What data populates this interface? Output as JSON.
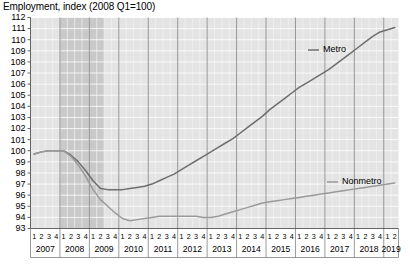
{
  "chart_data": {
    "type": "line",
    "title": "Employment, index (2008 Q1=100)",
    "xlabel": "",
    "ylabel": "",
    "ylim": [
      93,
      112
    ],
    "ytick_step": 1,
    "yticks": [
      112,
      111,
      110,
      109,
      108,
      107,
      106,
      105,
      104,
      103,
      102,
      101,
      100,
      99,
      98,
      97,
      96,
      95,
      94,
      93
    ],
    "grid": true,
    "legend_position": "inline-right",
    "quarter_labels": [
      "1",
      "2",
      "3",
      "4"
    ],
    "years": [
      {
        "year": "2007",
        "quarters": [
          "1",
          "2",
          "3",
          "4"
        ]
      },
      {
        "year": "2008",
        "quarters": [
          "1",
          "2",
          "3",
          "4"
        ]
      },
      {
        "year": "2009",
        "quarters": [
          "1",
          "2",
          "3",
          "4"
        ]
      },
      {
        "year": "2010",
        "quarters": [
          "1",
          "2",
          "3",
          "4"
        ]
      },
      {
        "year": "2011",
        "quarters": [
          "1",
          "2",
          "3",
          "4"
        ]
      },
      {
        "year": "2012",
        "quarters": [
          "1",
          "2",
          "3",
          "4"
        ]
      },
      {
        "year": "2013",
        "quarters": [
          "1",
          "2",
          "3",
          "4"
        ]
      },
      {
        "year": "2014",
        "quarters": [
          "1",
          "2",
          "3",
          "4"
        ]
      },
      {
        "year": "2015",
        "quarters": [
          "1",
          "2",
          "3",
          "4"
        ]
      },
      {
        "year": "2016",
        "quarters": [
          "1",
          "2",
          "3",
          "4"
        ]
      },
      {
        "year": "2017",
        "quarters": [
          "1",
          "2",
          "3",
          "4"
        ]
      },
      {
        "year": "2018",
        "quarters": [
          "1",
          "2",
          "3",
          "4"
        ]
      },
      {
        "year": "2019",
        "quarters": [
          "1",
          "2"
        ]
      }
    ],
    "x": [
      "2007Q1",
      "2007Q2",
      "2007Q3",
      "2007Q4",
      "2008Q1",
      "2008Q2",
      "2008Q3",
      "2008Q4",
      "2009Q1",
      "2009Q2",
      "2009Q3",
      "2009Q4",
      "2010Q1",
      "2010Q2",
      "2010Q3",
      "2010Q4",
      "2011Q1",
      "2011Q2",
      "2011Q3",
      "2011Q4",
      "2012Q1",
      "2012Q2",
      "2012Q3",
      "2012Q4",
      "2013Q1",
      "2013Q2",
      "2013Q3",
      "2013Q4",
      "2014Q1",
      "2014Q2",
      "2014Q3",
      "2014Q4",
      "2015Q1",
      "2015Q2",
      "2015Q3",
      "2015Q4",
      "2016Q1",
      "2016Q2",
      "2016Q3",
      "2016Q4",
      "2017Q1",
      "2017Q2",
      "2017Q3",
      "2017Q4",
      "2018Q1",
      "2018Q2",
      "2018Q3",
      "2018Q4",
      "2019Q1",
      "2019Q2"
    ],
    "series": [
      {
        "name": "Metro",
        "color": "#6e6e6e",
        "values": [
          99.7,
          99.9,
          100.0,
          100.0,
          100.0,
          99.6,
          99.0,
          98.2,
          97.3,
          96.6,
          96.5,
          96.5,
          96.5,
          96.6,
          96.7,
          96.8,
          97.0,
          97.3,
          97.6,
          97.9,
          98.3,
          98.7,
          99.1,
          99.5,
          99.9,
          100.3,
          100.7,
          101.1,
          101.6,
          102.1,
          102.6,
          103.1,
          103.7,
          104.2,
          104.7,
          105.2,
          105.7,
          106.1,
          106.5,
          106.9,
          107.3,
          107.8,
          108.3,
          108.8,
          109.3,
          109.8,
          110.3,
          110.7,
          110.9,
          111.1
        ]
      },
      {
        "name": "Nonmetro",
        "color": "#9a9a9a",
        "values": [
          99.7,
          99.9,
          100.0,
          100.0,
          100.0,
          99.5,
          98.7,
          97.7,
          96.5,
          95.6,
          95.0,
          94.4,
          93.9,
          93.7,
          93.8,
          93.9,
          94.0,
          94.1,
          94.1,
          94.1,
          94.1,
          94.1,
          94.1,
          94.0,
          94.0,
          94.1,
          94.3,
          94.5,
          94.7,
          94.9,
          95.1,
          95.3,
          95.4,
          95.5,
          95.6,
          95.7,
          95.8,
          95.9,
          96.0,
          96.1,
          96.2,
          96.3,
          96.4,
          96.5,
          96.6,
          96.7,
          96.8,
          96.9,
          97.0,
          97.1
        ]
      }
    ],
    "recession_band": {
      "label": "recession-shading",
      "start": "2008Q1",
      "end": "2009Q2",
      "color": "#c9c9c9"
    },
    "legend": [
      {
        "label": "Metro",
        "color": "#6e6e6e"
      },
      {
        "label": "Nonmetro",
        "color": "#9a9a9a"
      }
    ]
  }
}
